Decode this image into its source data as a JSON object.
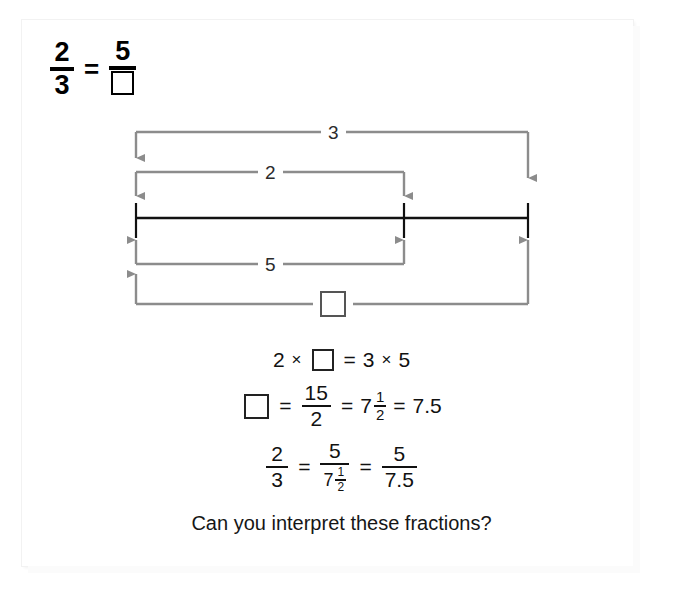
{
  "page": {
    "background_color": "#ffffff",
    "frame_color": "#f2f2f2"
  },
  "top_equation": {
    "left_fraction": {
      "numerator": "2",
      "denominator": "3"
    },
    "equals": "=",
    "right_fraction": {
      "numerator": "5",
      "denominator_is_box": true,
      "denominator": ""
    }
  },
  "diagram": {
    "line_color": "#8c8c8c",
    "axis_color": "#000000",
    "labels": {
      "top_outer": "3",
      "top_inner": "2",
      "bottom_inner": "5",
      "bottom_outer_is_box": true,
      "bottom_outer": ""
    },
    "axis": {
      "start_x": 136,
      "tick_x": 404,
      "end_x": 528,
      "y": 218
    }
  },
  "equations": {
    "line1": {
      "a": "2",
      "times": "×",
      "box": "",
      "equals": "=",
      "b": "3",
      "times2": "×",
      "c": "5"
    },
    "line2": {
      "box": "",
      "equals1": "=",
      "fraction": {
        "numerator": "15",
        "denominator": "2"
      },
      "equals2": "=",
      "mixed": {
        "whole": "7",
        "numerator": "1",
        "denominator": "2"
      },
      "equals3": "=",
      "decimal": "7.5"
    },
    "line3": {
      "fraction1": {
        "numerator": "2",
        "denominator": "3"
      },
      "equals1": "=",
      "fraction2": {
        "numerator": "5",
        "denominator_mixed": {
          "whole": "7",
          "numerator": "1",
          "denominator": "2"
        }
      },
      "equals2": "=",
      "fraction3": {
        "numerator": "5",
        "denominator": "7.5"
      }
    }
  },
  "caption": {
    "text": "Can you interpret these fractions?"
  }
}
